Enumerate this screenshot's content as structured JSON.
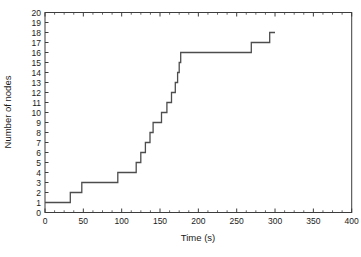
{
  "figure": {
    "background": "#ffffff",
    "frame_color": "#3d3d3d",
    "line_color": "#4d4d4d",
    "text_color": "#1a1a1a"
  },
  "chart_data": {
    "type": "line",
    "subtype": "step-post",
    "title": "",
    "xlabel": "Time (s)",
    "ylabel": "Number of nodes",
    "xlim": [
      0,
      400
    ],
    "ylim": [
      0,
      20
    ],
    "x_major_tick_step": 50,
    "x_minor_tick_step": 12.5,
    "x_major_ticks": [
      0,
      50,
      100,
      150,
      200,
      250,
      300,
      350,
      400
    ],
    "y_tick_step": 1,
    "y_ticks": [
      0,
      1,
      2,
      3,
      4,
      5,
      6,
      7,
      8,
      9,
      10,
      11,
      12,
      13,
      14,
      15,
      16,
      17,
      18,
      19,
      20
    ],
    "grid": false,
    "legend": null,
    "series": [
      {
        "name": "number-of-nodes",
        "end_time": 300,
        "steps": [
          {
            "t": 0,
            "n": 1
          },
          {
            "t": 33,
            "n": 2
          },
          {
            "t": 48,
            "n": 3
          },
          {
            "t": 95,
            "n": 4
          },
          {
            "t": 119,
            "n": 5
          },
          {
            "t": 125,
            "n": 6
          },
          {
            "t": 131,
            "n": 7
          },
          {
            "t": 137,
            "n": 8
          },
          {
            "t": 141,
            "n": 9
          },
          {
            "t": 152,
            "n": 10
          },
          {
            "t": 159,
            "n": 11
          },
          {
            "t": 165,
            "n": 12
          },
          {
            "t": 170,
            "n": 13
          },
          {
            "t": 173,
            "n": 14
          },
          {
            "t": 175,
            "n": 15
          },
          {
            "t": 177,
            "n": 16
          },
          {
            "t": 269,
            "n": 17
          },
          {
            "t": 293,
            "n": 18
          }
        ]
      }
    ]
  }
}
